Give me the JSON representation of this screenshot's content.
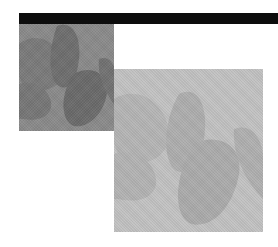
{
  "composition": {
    "bar_color": "#0d0d0d",
    "background_color": "#ffffff",
    "images": [
      {
        "name": "dark-petals-photo",
        "tone": "dark",
        "base_color": "#8a8a8a",
        "shape_color": "#6e6e6e"
      },
      {
        "name": "light-petals-photo",
        "tone": "light",
        "base_color": "#c2c2c2",
        "shape_color": "#acacac"
      }
    ]
  }
}
